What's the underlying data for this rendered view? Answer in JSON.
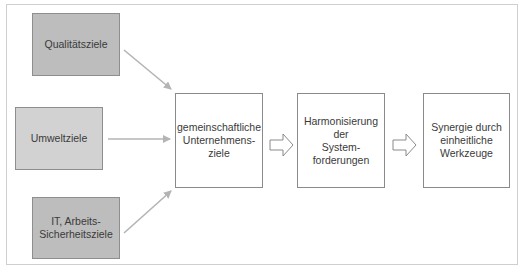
{
  "diagram": {
    "type": "flow",
    "sources": [
      {
        "id": "qualitaet",
        "label": "Qualitätsziele",
        "fill": "#bdbdbd"
      },
      {
        "id": "umwelt",
        "label": "Umweltziele",
        "fill": "#d2d2d2"
      },
      {
        "id": "it",
        "label": "IT, Arbeits-\nSicherheitsziele",
        "fill": "#bdbdbd"
      }
    ],
    "stages": [
      {
        "id": "gemeinsam",
        "label": "gemeinschaftliche\nUnternehmens-\nziele"
      },
      {
        "id": "harmonisierung",
        "label": "Harmonisierung\nder\nSystem-\nforderungen"
      },
      {
        "id": "synergie",
        "label": "Synergie durch\neinheitliche\nWerkzeuge"
      }
    ],
    "edges": [
      {
        "from": "qualitaet",
        "to": "gemeinsam",
        "style": "thin-gray-arrow"
      },
      {
        "from": "umwelt",
        "to": "gemeinsam",
        "style": "thin-gray-arrow"
      },
      {
        "from": "it",
        "to": "gemeinsam",
        "style": "thin-gray-arrow"
      },
      {
        "from": "gemeinsam",
        "to": "harmonisierung",
        "style": "block-arrow"
      },
      {
        "from": "harmonisierung",
        "to": "synergie",
        "style": "block-arrow"
      }
    ],
    "colors": {
      "frame_border": "#cfcfcf",
      "box_border": "#8a8a8a",
      "connector": "#b4b4b4",
      "text": "#3a3a3a"
    }
  }
}
